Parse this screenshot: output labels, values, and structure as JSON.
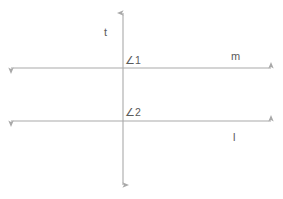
{
  "diagram": {
    "kind": "transversal-parallel-lines",
    "background_color": "#ffffff",
    "line_color": "#a9a9a9",
    "text_color": "#5a5a5a",
    "lines": [
      {
        "name": "t",
        "label": "t",
        "orientation": "vertical",
        "x": 123,
        "y_start": 12,
        "y_end": 186,
        "arrows": "both"
      },
      {
        "name": "m",
        "label": "m",
        "orientation": "horizontal",
        "y": 68,
        "x_start": 10,
        "x_end": 272,
        "arrows": "both"
      },
      {
        "name": "l",
        "label": "l",
        "orientation": "horizontal",
        "y": 121,
        "x_start": 10,
        "x_end": 272,
        "arrows": "both"
      }
    ],
    "angles": [
      {
        "name": "angle-1",
        "label": "∠1",
        "at_intersection": "t-and-m",
        "position": "above-right"
      },
      {
        "name": "angle-2",
        "label": "∠2",
        "at_intersection": "t-and-l",
        "position": "above-right"
      }
    ]
  }
}
